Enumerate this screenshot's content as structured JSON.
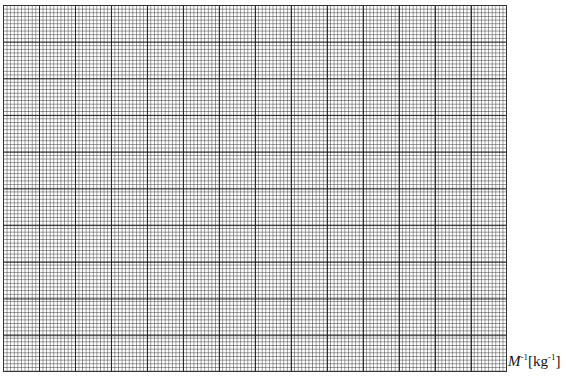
{
  "graph_paper": {
    "major_columns": 14,
    "major_rows": 10,
    "minor_divisions_per_major": 10
  },
  "axis_label": {
    "symbol": "M",
    "symbol_exponent": "-1",
    "unit_open": "[kg",
    "unit_exponent": "-1",
    "unit_close": "]"
  }
}
